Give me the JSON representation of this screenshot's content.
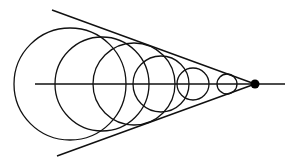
{
  "diagram": {
    "type": "geometric",
    "colors": {
      "stroke": "#111111",
      "background": "#ffffff",
      "apex": "#000000"
    },
    "axis": {
      "x1": 35,
      "y1": 84,
      "x2": 285,
      "y2": 84
    },
    "tangent_lines": [
      {
        "x1": 52,
        "y1": 10,
        "x2": 255,
        "y2": 84
      },
      {
        "x1": 57,
        "y1": 156,
        "x2": 255,
        "y2": 84
      }
    ],
    "apex": {
      "cx": 255,
      "cy": 84,
      "r": 4.5
    },
    "circles": [
      {
        "cx": 70,
        "cy": 84,
        "r": 56
      },
      {
        "cx": 102,
        "cy": 84,
        "r": 47
      },
      {
        "cx": 134,
        "cy": 84,
        "r": 41
      },
      {
        "cx": 161,
        "cy": 84,
        "r": 28
      },
      {
        "cx": 193,
        "cy": 84,
        "r": 16
      },
      {
        "cx": 227,
        "cy": 84,
        "r": 10
      }
    ]
  }
}
